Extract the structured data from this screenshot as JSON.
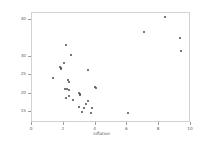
{
  "chart_data": {
    "type": "scatter",
    "title": "",
    "xlabel": "inflation",
    "ylabel": "",
    "xlim": [
      0,
      10
    ],
    "ylim": [
      12,
      42
    ],
    "grid": false,
    "legend": null,
    "xticks": [
      {
        "value": 0,
        "label": "0"
      },
      {
        "value": 2,
        "label": "2"
      },
      {
        "value": 4,
        "label": "4"
      },
      {
        "value": 6,
        "label": "6"
      },
      {
        "value": 8,
        "label": "8"
      },
      {
        "value": 10,
        "label": "10"
      }
    ],
    "yticks": [
      {
        "value": 40,
        "label": "40"
      },
      {
        "value": 30,
        "label": "30"
      },
      {
        "value": 25,
        "label": "25"
      },
      {
        "value": 20,
        "label": "20"
      },
      {
        "value": 15,
        "label": "15"
      }
    ],
    "marker": {
      "shape": "circle",
      "color": "#4a4a4a",
      "size": 2
    },
    "points": [
      {
        "x": 8.35,
        "y": 40.9
      },
      {
        "x": 7.05,
        "y": 36.8
      },
      {
        "x": 9.3,
        "y": 35.3
      },
      {
        "x": 9.35,
        "y": 31.6
      },
      {
        "x": 2.15,
        "y": 33.3
      },
      {
        "x": 2.45,
        "y": 30.6
      },
      {
        "x": 2.0,
        "y": 28.3
      },
      {
        "x": 1.75,
        "y": 27.3
      },
      {
        "x": 1.85,
        "y": 27.0
      },
      {
        "x": 1.8,
        "y": 26.7
      },
      {
        "x": 3.5,
        "y": 26.4
      },
      {
        "x": 1.3,
        "y": 24.3
      },
      {
        "x": 2.25,
        "y": 23.8
      },
      {
        "x": 2.3,
        "y": 23.2
      },
      {
        "x": 3.95,
        "y": 21.7
      },
      {
        "x": 4.05,
        "y": 21.5
      },
      {
        "x": 2.05,
        "y": 21.3
      },
      {
        "x": 2.2,
        "y": 21.2
      },
      {
        "x": 2.35,
        "y": 21.0
      },
      {
        "x": 2.95,
        "y": 20.3
      },
      {
        "x": 3.05,
        "y": 20.0
      },
      {
        "x": 3.0,
        "y": 19.6
      },
      {
        "x": 2.3,
        "y": 19.4
      },
      {
        "x": 2.15,
        "y": 18.7
      },
      {
        "x": 2.6,
        "y": 18.3
      },
      {
        "x": 3.55,
        "y": 17.9
      },
      {
        "x": 3.4,
        "y": 17.2
      },
      {
        "x": 2.95,
        "y": 16.4
      },
      {
        "x": 3.3,
        "y": 16.2
      },
      {
        "x": 3.8,
        "y": 16.0
      },
      {
        "x": 3.15,
        "y": 15.1
      },
      {
        "x": 3.7,
        "y": 14.8
      },
      {
        "x": 6.05,
        "y": 14.6
      }
    ]
  }
}
